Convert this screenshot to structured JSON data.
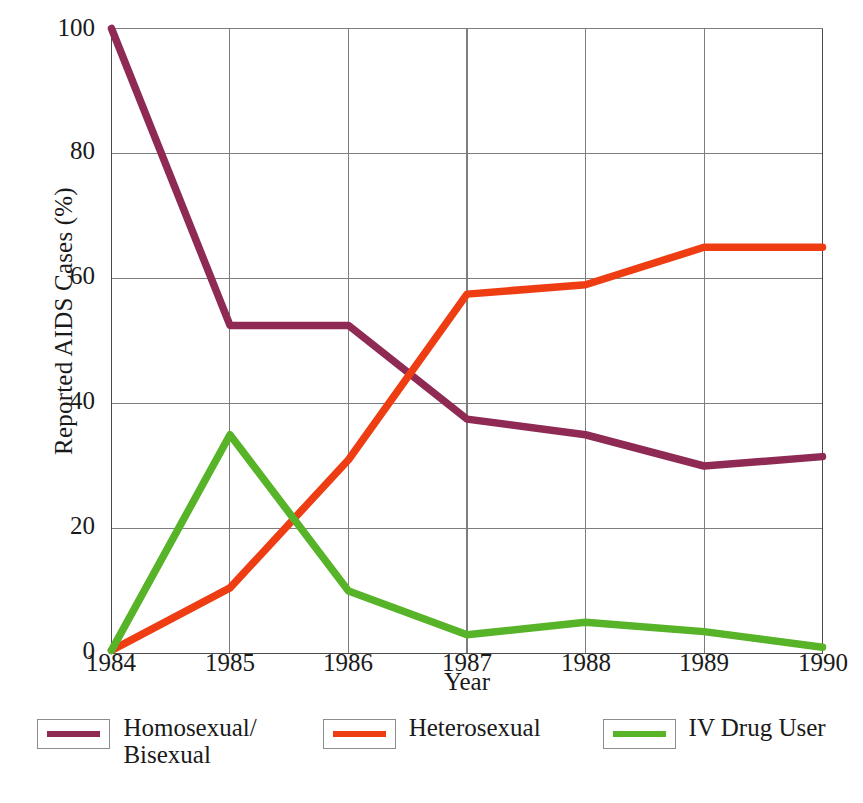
{
  "chart_data": {
    "type": "line",
    "title": "",
    "xlabel": "Year",
    "ylabel": "Reported AIDS Cases (%)",
    "x": [
      "1984",
      "1985",
      "1986",
      "1987",
      "1988",
      "1989",
      "1990"
    ],
    "categories": [
      "1984",
      "1985",
      "1986",
      "1987",
      "1988",
      "1989",
      "1990"
    ],
    "xlim": [
      1984,
      1990
    ],
    "ylim": [
      0,
      100
    ],
    "yticks": [
      0,
      20,
      40,
      60,
      80,
      100
    ],
    "ytick_labels": [
      "0",
      "20",
      "40",
      "60",
      "80",
      "100"
    ],
    "xticks": [
      1984,
      1985,
      1986,
      1987,
      1988,
      1989,
      1990
    ],
    "grid": true,
    "legend_position": "bottom",
    "series": [
      {
        "name": "Homosexual/\nBisexual",
        "legend_label": "Homosexual/\nBisexual",
        "color": "#8E2A53",
        "values": [
          100,
          52.5,
          52.5,
          37.5,
          35,
          30,
          31.5
        ]
      },
      {
        "name": "Heterosexual",
        "legend_label": "Heterosexual",
        "color": "#EE3D13",
        "values": [
          0.5,
          10.5,
          31,
          57.5,
          59,
          65,
          65
        ]
      },
      {
        "name": "IV Drug User",
        "legend_label": "IV Drug User",
        "color": "#57B327",
        "values": [
          0.5,
          35,
          10,
          3,
          5,
          3.5,
          1
        ]
      }
    ]
  },
  "axes": {
    "y_title": "Reported AIDS Cases (%)",
    "x_title": "Year",
    "ytick_0": "0",
    "ytick_1": "20",
    "ytick_2": "40",
    "ytick_3": "60",
    "ytick_4": "80",
    "ytick_5": "100",
    "xtick_0": "1984",
    "xtick_1": "1985",
    "xtick_2": "1986",
    "xtick_3": "1987",
    "xtick_4": "1988",
    "xtick_5": "1989",
    "xtick_6": "1990"
  },
  "legend": {
    "items": [
      {
        "label": "Homosexual/\nBisexual",
        "color": "#8E2A53"
      },
      {
        "label": "Heterosexual",
        "color": "#EE3D13"
      },
      {
        "label": "IV Drug User",
        "color": "#57B327"
      }
    ]
  },
  "colors": {
    "homosexual_bisexual": "#8E2A53",
    "heterosexual": "#EE3D13",
    "iv_drug_user": "#57B327",
    "grid": "#7d7d7d",
    "axis": "#4a4a4a",
    "background": "#ffffff"
  }
}
